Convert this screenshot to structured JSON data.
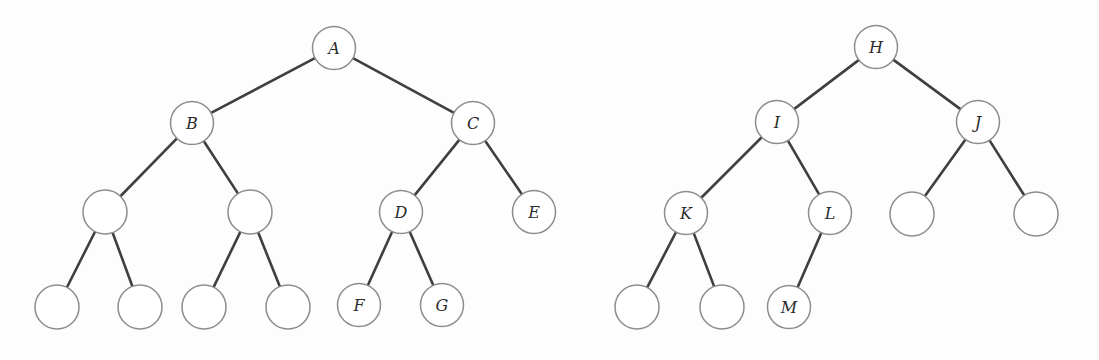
{
  "figure": {
    "background_color": "#fdfdfd",
    "node_fill_color": "#ffffff",
    "node_stroke_color": "#8d8d8d",
    "edge_color": "#3f3f3f",
    "label_color": "#2b2b2b",
    "node_radius": 21.5
  },
  "trees": [
    {
      "name": "left-tree",
      "root": "A",
      "nodes": [
        {
          "id": "A",
          "label": "A",
          "cx": 334,
          "cy": 48,
          "r": 21.5
        },
        {
          "id": "B",
          "label": "B",
          "cx": 192,
          "cy": 123,
          "r": 21.5
        },
        {
          "id": "C",
          "label": "C",
          "cx": 473,
          "cy": 123,
          "r": 21.5
        },
        {
          "id": "n1",
          "label": "",
          "cx": 105,
          "cy": 212,
          "r": 22.0
        },
        {
          "id": "n2",
          "label": "",
          "cx": 250,
          "cy": 212,
          "r": 22.0
        },
        {
          "id": "D",
          "label": "D",
          "cx": 401,
          "cy": 212,
          "r": 21.5
        },
        {
          "id": "E",
          "label": "E",
          "cx": 534,
          "cy": 212,
          "r": 21.5
        },
        {
          "id": "n3",
          "label": "",
          "cx": 57,
          "cy": 307,
          "r": 22.0
        },
        {
          "id": "n4",
          "label": "",
          "cx": 140,
          "cy": 307,
          "r": 22.0
        },
        {
          "id": "n5",
          "label": "",
          "cx": 204,
          "cy": 307,
          "r": 22.0
        },
        {
          "id": "n6",
          "label": "",
          "cx": 288,
          "cy": 307,
          "r": 22.0
        },
        {
          "id": "F",
          "label": "F",
          "cx": 359,
          "cy": 305,
          "r": 21.5
        },
        {
          "id": "G",
          "label": "G",
          "cx": 442,
          "cy": 305,
          "r": 21.5
        }
      ],
      "edges": [
        {
          "from": "A",
          "to": "B"
        },
        {
          "from": "A",
          "to": "C"
        },
        {
          "from": "B",
          "to": "n1"
        },
        {
          "from": "B",
          "to": "n2"
        },
        {
          "from": "C",
          "to": "D"
        },
        {
          "from": "C",
          "to": "E"
        },
        {
          "from": "n1",
          "to": "n3"
        },
        {
          "from": "n1",
          "to": "n4"
        },
        {
          "from": "n2",
          "to": "n5"
        },
        {
          "from": "n2",
          "to": "n6"
        },
        {
          "from": "D",
          "to": "F"
        },
        {
          "from": "D",
          "to": "G"
        }
      ]
    },
    {
      "name": "right-tree",
      "root": "H",
      "nodes": [
        {
          "id": "H",
          "label": "H",
          "cx": 876,
          "cy": 47,
          "r": 21.5
        },
        {
          "id": "I",
          "label": "I",
          "cx": 777,
          "cy": 122,
          "r": 21.5
        },
        {
          "id": "J",
          "label": "J",
          "cx": 978,
          "cy": 122,
          "r": 21.5
        },
        {
          "id": "K",
          "label": "K",
          "cx": 686,
          "cy": 213,
          "r": 21.5
        },
        {
          "id": "L",
          "label": "L",
          "cx": 830,
          "cy": 213,
          "r": 21.5
        },
        {
          "id": "m1",
          "label": "",
          "cx": 912,
          "cy": 214,
          "r": 22.0
        },
        {
          "id": "m2",
          "label": "",
          "cx": 1036,
          "cy": 214,
          "r": 22.0
        },
        {
          "id": "m3",
          "label": "",
          "cx": 637,
          "cy": 307,
          "r": 22.0
        },
        {
          "id": "m4",
          "label": "",
          "cx": 722,
          "cy": 307,
          "r": 22.0
        },
        {
          "id": "M",
          "label": "M",
          "cx": 789,
          "cy": 307,
          "r": 21.5
        }
      ],
      "edges": [
        {
          "from": "H",
          "to": "I"
        },
        {
          "from": "H",
          "to": "J"
        },
        {
          "from": "I",
          "to": "K"
        },
        {
          "from": "I",
          "to": "L"
        },
        {
          "from": "J",
          "to": "m1"
        },
        {
          "from": "J",
          "to": "m2"
        },
        {
          "from": "K",
          "to": "m3"
        },
        {
          "from": "K",
          "to": "m4"
        },
        {
          "from": "L",
          "to": "M"
        }
      ]
    }
  ]
}
